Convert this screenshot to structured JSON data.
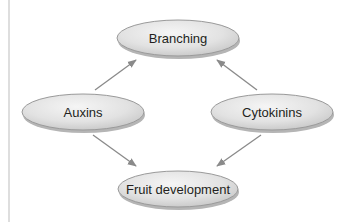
{
  "diagram": {
    "colors": {
      "node_fill_light": "#f2f2f2",
      "node_fill_dark": "#c9c9c9",
      "node_stroke": "#9a9a9a",
      "node_shadow": "#b5b5b5",
      "edge": "#8a8a8a",
      "text": "#231f20",
      "left_rule": "#c8c8c8"
    },
    "nodes": [
      {
        "id": "branching",
        "label": "Branching",
        "cx": 178,
        "cy": 38,
        "rx": 61,
        "ry": 18
      },
      {
        "id": "auxins",
        "label": "Auxins",
        "cx": 83,
        "cy": 112,
        "rx": 61,
        "ry": 18
      },
      {
        "id": "cytokinins",
        "label": "Cytokinins",
        "cx": 272,
        "cy": 112,
        "rx": 61,
        "ry": 18
      },
      {
        "id": "fruit",
        "label": "Fruit development",
        "cx": 178,
        "cy": 189,
        "rx": 60,
        "ry": 18
      }
    ],
    "edges": [
      {
        "from": "auxins",
        "to": "branching"
      },
      {
        "from": "cytokinins",
        "to": "branching"
      },
      {
        "from": "auxins",
        "to": "fruit"
      },
      {
        "from": "cytokinins",
        "to": "fruit"
      }
    ]
  }
}
